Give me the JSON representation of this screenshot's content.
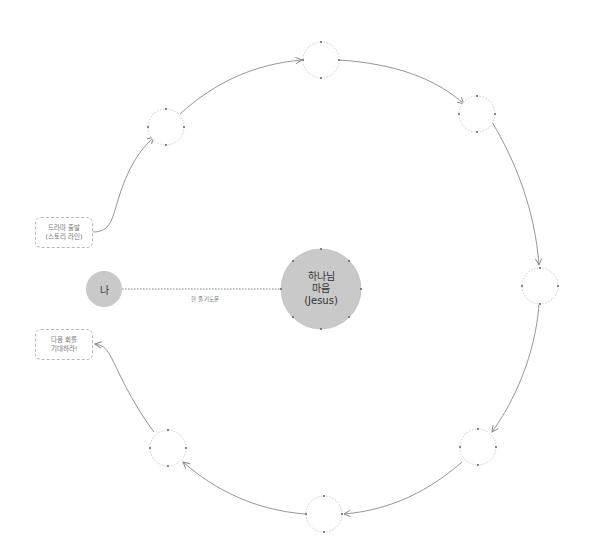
{
  "diagram": {
    "center_node": {
      "line1": "하나님",
      "line2": "마음",
      "line3": "(Jesus)",
      "fill": "#c9c9c9"
    },
    "me_node": {
      "label": "나",
      "fill": "#c9c9c9"
    },
    "connector_label": "한 줄 기도문",
    "start_box": {
      "line1": "드라마 출발",
      "line2": "(스토리 라인)"
    },
    "end_box": {
      "line1": "다음 회를",
      "line2": "기대하라!"
    },
    "cycle_nodes": [
      {
        "position": "upper-left",
        "label": ""
      },
      {
        "position": "top",
        "label": ""
      },
      {
        "position": "upper-right",
        "label": ""
      },
      {
        "position": "right",
        "label": ""
      },
      {
        "position": "lower-right",
        "label": ""
      },
      {
        "position": "bottom",
        "label": ""
      },
      {
        "position": "lower-left",
        "label": ""
      }
    ],
    "colors": {
      "line": "#8a8a8a",
      "dashed_outline": "#bdbdbd",
      "anchor_dot": "#555555",
      "node_fill": "#c9c9c9"
    }
  }
}
